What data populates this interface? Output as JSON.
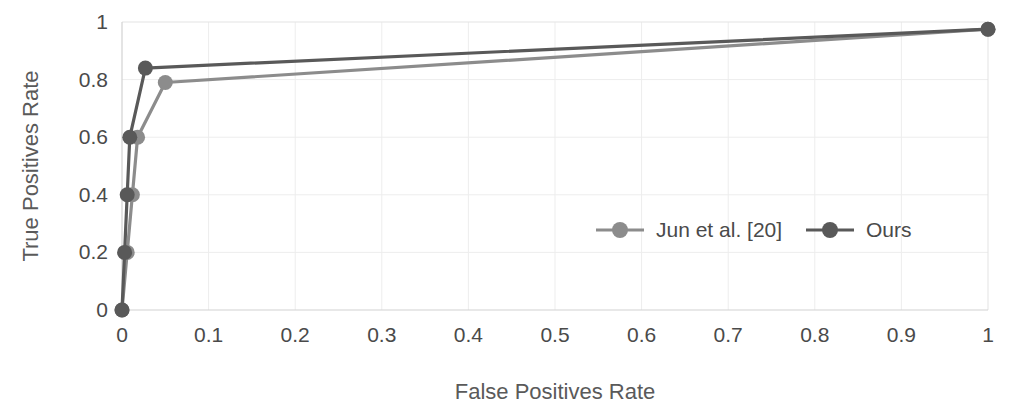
{
  "chart_data": {
    "type": "line",
    "title": "",
    "xlabel": "False Positives Rate",
    "ylabel": "True Positives Rate",
    "xlim": [
      0,
      1
    ],
    "ylim": [
      0,
      1
    ],
    "xticks": [
      "0",
      "0.1",
      "0.2",
      "0.3",
      "0.4",
      "0.5",
      "0.6",
      "0.7",
      "0.8",
      "0.9",
      "1"
    ],
    "xtick_values": [
      0,
      0.1,
      0.2,
      0.3,
      0.4,
      0.5,
      0.6,
      0.7,
      0.8,
      0.9,
      1
    ],
    "yticks": [
      "0",
      "0.2",
      "0.4",
      "0.6",
      "0.8",
      "1"
    ],
    "ytick_values": [
      0,
      0.2,
      0.4,
      0.6,
      0.8,
      1
    ],
    "grid": true,
    "legend_position": "center-right-inside",
    "series": [
      {
        "name": "Jun et al. [20]",
        "color": "#8c8c8c",
        "marker": "circle",
        "points": [
          {
            "x": 0.0,
            "y": 0.0
          },
          {
            "x": 0.006,
            "y": 0.2
          },
          {
            "x": 0.012,
            "y": 0.4
          },
          {
            "x": 0.018,
            "y": 0.6
          },
          {
            "x": 0.05,
            "y": 0.79
          },
          {
            "x": 1.0,
            "y": 0.975
          }
        ]
      },
      {
        "name": "Ours",
        "color": "#595959",
        "marker": "circle",
        "points": [
          {
            "x": 0.0,
            "y": 0.0
          },
          {
            "x": 0.003,
            "y": 0.2
          },
          {
            "x": 0.006,
            "y": 0.4
          },
          {
            "x": 0.009,
            "y": 0.6
          },
          {
            "x": 0.027,
            "y": 0.84
          },
          {
            "x": 1.0,
            "y": 0.975
          }
        ]
      }
    ]
  },
  "legend": {
    "items": [
      {
        "label": "Jun et al. [20]",
        "color": "#8c8c8c"
      },
      {
        "label": "Ours",
        "color": "#595959"
      }
    ]
  },
  "axes": {
    "x_title": "False Positives Rate",
    "y_title": "True Positives Rate"
  }
}
